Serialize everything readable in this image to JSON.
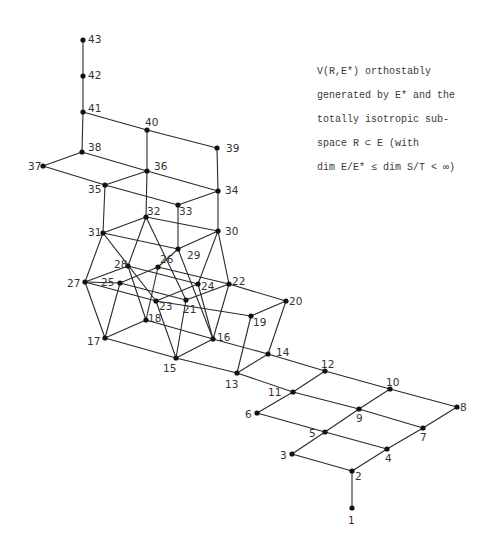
{
  "caption": {
    "lines": [
      "V(R,E*) orthostably",
      "generated by  E*  and the",
      "totally isotropic sub-",
      "space  R ⊂ E  (with",
      "dim E/E* ≤ dim S/T < ∞)"
    ]
  },
  "colors": {
    "edge": "#2a2a2a",
    "node": "#111111",
    "label": "#333333",
    "background": "#ffffff"
  },
  "nodes": [
    {
      "id": "1",
      "x": 352,
      "y": 508,
      "lx": 348,
      "ly": 524
    },
    {
      "id": "2",
      "x": 352,
      "y": 471,
      "lx": 355,
      "ly": 480
    },
    {
      "id": "3",
      "x": 292,
      "y": 454,
      "lx": 280,
      "ly": 459
    },
    {
      "id": "4",
      "x": 387,
      "y": 449,
      "lx": 385,
      "ly": 462
    },
    {
      "id": "5",
      "x": 325,
      "y": 432,
      "lx": 309,
      "ly": 437
    },
    {
      "id": "6",
      "x": 257,
      "y": 413,
      "lx": 245,
      "ly": 418
    },
    {
      "id": "7",
      "x": 423,
      "y": 428,
      "lx": 420,
      "ly": 441
    },
    {
      "id": "8",
      "x": 457,
      "y": 407,
      "lx": 460,
      "ly": 411
    },
    {
      "id": "9",
      "x": 359,
      "y": 409,
      "lx": 356,
      "ly": 422
    },
    {
      "id": "10",
      "x": 390,
      "y": 389,
      "lx": 386,
      "ly": 386
    },
    {
      "id": "11",
      "x": 293,
      "y": 392,
      "lx": 268,
      "ly": 396
    },
    {
      "id": "12",
      "x": 325,
      "y": 371,
      "lx": 321,
      "ly": 368
    },
    {
      "id": "13",
      "x": 237,
      "y": 373,
      "lx": 225,
      "ly": 388
    },
    {
      "id": "14",
      "x": 268,
      "y": 354,
      "lx": 276,
      "ly": 356
    },
    {
      "id": "15",
      "x": 176,
      "y": 358,
      "lx": 163,
      "ly": 372
    },
    {
      "id": "16",
      "x": 213,
      "y": 339,
      "lx": 217,
      "ly": 341
    },
    {
      "id": "17",
      "x": 105,
      "y": 338,
      "lx": 87,
      "ly": 345
    },
    {
      "id": "18",
      "x": 146,
      "y": 320,
      "lx": 148,
      "ly": 322
    },
    {
      "id": "19",
      "x": 251,
      "y": 316,
      "lx": 253,
      "ly": 326
    },
    {
      "id": "20",
      "x": 286,
      "y": 301,
      "lx": 289,
      "ly": 305
    },
    {
      "id": "21",
      "x": 186,
      "y": 300,
      "lx": 183,
      "ly": 313
    },
    {
      "id": "22",
      "x": 229,
      "y": 284,
      "lx": 232,
      "ly": 285
    },
    {
      "id": "23",
      "x": 156,
      "y": 301,
      "lx": 159,
      "ly": 310
    },
    {
      "id": "24",
      "x": 198,
      "y": 284,
      "lx": 201,
      "ly": 290
    },
    {
      "id": "25",
      "x": 120,
      "y": 283,
      "lx": 101,
      "ly": 286
    },
    {
      "id": "26",
      "x": 158,
      "y": 267,
      "lx": 160,
      "ly": 263
    },
    {
      "id": "27",
      "x": 85,
      "y": 282,
      "lx": 67,
      "ly": 287
    },
    {
      "id": "28",
      "x": 128,
      "y": 266,
      "lx": 114,
      "ly": 268
    },
    {
      "id": "29",
      "x": 178,
      "y": 249,
      "lx": 187,
      "ly": 259
    },
    {
      "id": "30",
      "x": 218,
      "y": 231,
      "lx": 225,
      "ly": 235
    },
    {
      "id": "31",
      "x": 103,
      "y": 233,
      "lx": 88,
      "ly": 236
    },
    {
      "id": "32",
      "x": 146,
      "y": 217,
      "lx": 147,
      "ly": 215
    },
    {
      "id": "33",
      "x": 178,
      "y": 205,
      "lx": 179,
      "ly": 215
    },
    {
      "id": "34",
      "x": 218,
      "y": 191,
      "lx": 225,
      "ly": 194
    },
    {
      "id": "35",
      "x": 105,
      "y": 185,
      "lx": 88,
      "ly": 193
    },
    {
      "id": "36",
      "x": 147,
      "y": 171,
      "lx": 154,
      "ly": 170
    },
    {
      "id": "37",
      "x": 43,
      "y": 166,
      "lx": 28,
      "ly": 170
    },
    {
      "id": "38",
      "x": 82,
      "y": 152,
      "lx": 88,
      "ly": 151
    },
    {
      "id": "39",
      "x": 217,
      "y": 148,
      "lx": 226,
      "ly": 152
    },
    {
      "id": "40",
      "x": 147,
      "y": 130,
      "lx": 145,
      "ly": 126
    },
    {
      "id": "41",
      "x": 83,
      "y": 112,
      "lx": 88,
      "ly": 112
    },
    {
      "id": "42",
      "x": 83,
      "y": 76,
      "lx": 88,
      "ly": 79
    },
    {
      "id": "43",
      "x": 83,
      "y": 40,
      "lx": 88,
      "ly": 43
    }
  ],
  "edges": [
    [
      "1",
      "2"
    ],
    [
      "2",
      "3"
    ],
    [
      "2",
      "4"
    ],
    [
      "3",
      "5"
    ],
    [
      "4",
      "5"
    ],
    [
      "4",
      "7"
    ],
    [
      "5",
      "6"
    ],
    [
      "5",
      "9"
    ],
    [
      "7",
      "8"
    ],
    [
      "7",
      "9"
    ],
    [
      "6",
      "11"
    ],
    [
      "9",
      "11"
    ],
    [
      "9",
      "10"
    ],
    [
      "8",
      "10"
    ],
    [
      "10",
      "12"
    ],
    [
      "11",
      "12"
    ],
    [
      "11",
      "13"
    ],
    [
      "12",
      "14"
    ],
    [
      "13",
      "14"
    ],
    [
      "13",
      "15"
    ],
    [
      "14",
      "16"
    ],
    [
      "13",
      "19"
    ],
    [
      "14",
      "20"
    ],
    [
      "19",
      "20"
    ],
    [
      "15",
      "16"
    ],
    [
      "15",
      "17"
    ],
    [
      "16",
      "18"
    ],
    [
      "17",
      "18"
    ],
    [
      "19",
      "23"
    ],
    [
      "20",
      "22"
    ],
    [
      "15",
      "23"
    ],
    [
      "15",
      "21"
    ],
    [
      "16",
      "24"
    ],
    [
      "16",
      "22"
    ],
    [
      "17",
      "27"
    ],
    [
      "17",
      "25"
    ],
    [
      "18",
      "28"
    ],
    [
      "18",
      "26"
    ],
    [
      "27",
      "25"
    ],
    [
      "27",
      "28"
    ],
    [
      "25",
      "26"
    ],
    [
      "28",
      "24"
    ],
    [
      "26",
      "22"
    ],
    [
      "27",
      "23"
    ],
    [
      "25",
      "21"
    ],
    [
      "23",
      "24"
    ],
    [
      "21",
      "22"
    ],
    [
      "31",
      "27"
    ],
    [
      "31",
      "23"
    ],
    [
      "32",
      "28"
    ],
    [
      "32",
      "21"
    ],
    [
      "29",
      "26"
    ],
    [
      "29",
      "16"
    ],
    [
      "30",
      "24"
    ],
    [
      "30",
      "22"
    ],
    [
      "31",
      "32"
    ],
    [
      "31",
      "29"
    ],
    [
      "32",
      "30"
    ],
    [
      "29",
      "30"
    ],
    [
      "31",
      "35"
    ],
    [
      "29",
      "33"
    ],
    [
      "30",
      "34"
    ],
    [
      "32",
      "36"
    ],
    [
      "35",
      "33"
    ],
    [
      "33",
      "34"
    ],
    [
      "35",
      "36"
    ],
    [
      "36",
      "34"
    ],
    [
      "35",
      "37"
    ],
    [
      "36",
      "38"
    ],
    [
      "37",
      "38"
    ],
    [
      "36",
      "40"
    ],
    [
      "34",
      "39"
    ],
    [
      "38",
      "41"
    ],
    [
      "40",
      "41"
    ],
    [
      "40",
      "39"
    ],
    [
      "41",
      "42"
    ],
    [
      "42",
      "43"
    ]
  ]
}
